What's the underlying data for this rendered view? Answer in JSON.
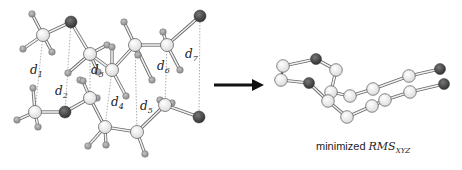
{
  "figure": {
    "left_panel": {
      "description": "Two stacked molecular chains with distance markers",
      "distance_labels": [
        {
          "base": "d",
          "sub": "1"
        },
        {
          "base": "d",
          "sub": "2"
        },
        {
          "base": "d",
          "sub": "3"
        },
        {
          "base": "d",
          "sub": "4"
        },
        {
          "base": "d",
          "sub": "5"
        },
        {
          "base": "d",
          "sub": "6"
        },
        {
          "base": "d",
          "sub": "7"
        }
      ]
    },
    "arrow": {
      "direction": "right"
    },
    "right_panel": {
      "description": "Superimposed minimized structures",
      "caption_prefix": "minimized ",
      "caption_italic": "RMS",
      "caption_sub": "XYZ"
    },
    "colors": {
      "carbon_fill": "#ffffff",
      "carbon_stroke": "#555555",
      "hydrogen_fill": "#9a9a9a",
      "hetero_fill": "#4a4a4a",
      "bond": "#777777",
      "dashed_line": "#999999",
      "arrow": "#111111"
    }
  }
}
